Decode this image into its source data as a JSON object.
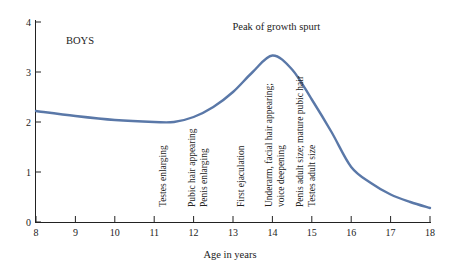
{
  "chart_data": {
    "type": "line",
    "title": "",
    "series_label": "BOYS",
    "xlabel": "Age in years",
    "ylabel": "",
    "xlim": [
      8,
      18
    ],
    "ylim": [
      0,
      4
    ],
    "x_ticks": [
      "8",
      "9",
      "10",
      "11",
      "12",
      "13",
      "14",
      "15",
      "16",
      "17",
      "18"
    ],
    "y_ticks": [
      "0",
      "1",
      "2",
      "3",
      "4"
    ],
    "grid": false,
    "line_color": "#5a78a8",
    "series": [
      {
        "name": "BOYS",
        "x": [
          8,
          9,
          10,
          11,
          11.5,
          12,
          12.5,
          13,
          13.5,
          14,
          14.5,
          15,
          15.5,
          16,
          16.5,
          17,
          17.5,
          18
        ],
        "values": [
          2.22,
          2.12,
          2.04,
          2.0,
          2.0,
          2.1,
          2.3,
          2.6,
          3.0,
          3.33,
          3.05,
          2.45,
          1.8,
          1.1,
          0.78,
          0.55,
          0.4,
          0.28
        ]
      }
    ],
    "annotations": [
      {
        "text": "Peak of growth spurt",
        "x": 14.1,
        "y": 3.85,
        "orientation": "horizontal"
      },
      {
        "text": "Testes enlarging",
        "x": 11.2,
        "orientation": "vertical"
      },
      {
        "text": "Pubic hair appearing",
        "x": 11.95,
        "orientation": "vertical"
      },
      {
        "text": "Penis enlarging",
        "x": 12.25,
        "orientation": "vertical"
      },
      {
        "text": "First ejaculation",
        "x": 13.2,
        "orientation": "vertical"
      },
      {
        "text": "Underarm, facial hair appearing;",
        "x": 13.9,
        "orientation": "vertical"
      },
      {
        "text": "voice deepening",
        "x": 14.2,
        "orientation": "vertical"
      },
      {
        "text": "Penis adult size; mature pubic hair",
        "x": 14.7,
        "orientation": "vertical"
      },
      {
        "text": "Testes adult size",
        "x": 15.0,
        "orientation": "vertical"
      }
    ]
  }
}
